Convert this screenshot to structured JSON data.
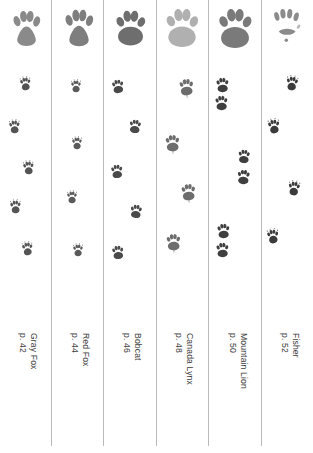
{
  "page": {
    "background_color": "#ffffff",
    "divider_color": "#b9b9b9",
    "text_color": "#3d3d3d",
    "columns_count": 6
  },
  "columns": [
    {
      "id": "gray-fox",
      "species": "Gray Fox",
      "page_ref": "p. 42",
      "x": 0,
      "width": 51,
      "hero_track": {
        "x": 10,
        "y": 8,
        "w": 33,
        "h": 42,
        "tone": "#8a8a8a",
        "style": "canine",
        "blur": 0.55
      },
      "trail": [
        {
          "x": 19,
          "y": 76,
          "size": 13,
          "rot": -6,
          "tone": "#545454"
        },
        {
          "x": 8,
          "y": 119,
          "size": 13,
          "rot": -4,
          "tone": "#545454"
        },
        {
          "x": 22,
          "y": 160,
          "size": 13,
          "rot": -5,
          "tone": "#545454"
        },
        {
          "x": 9,
          "y": 199,
          "size": 13,
          "rot": -3,
          "tone": "#545454"
        },
        {
          "x": 21,
          "y": 241,
          "size": 13,
          "rot": -6,
          "tone": "#545454"
        }
      ],
      "gait": "zigzag-single"
    },
    {
      "id": "red-fox",
      "species": "Red Fox",
      "page_ref": "p. 44",
      "x": 52,
      "width": 51,
      "hero_track": {
        "x": 10,
        "y": 6,
        "w": 34,
        "h": 45,
        "tone": "#7e7e7e",
        "style": "canine-furry",
        "blur": 0.7
      },
      "trail": [
        {
          "x": 18,
          "y": 79,
          "size": 12,
          "rot": -2,
          "tone": "#5a5a5a"
        },
        {
          "x": 19,
          "y": 136,
          "size": 12,
          "rot": -2,
          "tone": "#5a5a5a"
        },
        {
          "x": 14,
          "y": 190,
          "size": 12,
          "rot": -2,
          "tone": "#5a5a5a"
        },
        {
          "x": 20,
          "y": 243,
          "size": 12,
          "rot": -2,
          "tone": "#5a5a5a"
        }
      ],
      "gait": "direct-register-line"
    },
    {
      "id": "bobcat",
      "species": "Bobcat",
      "page_ref": "p. 46",
      "x": 104,
      "width": 51,
      "hero_track": {
        "x": 9,
        "y": 7,
        "w": 35,
        "h": 42,
        "tone": "#6e6e6e",
        "style": "feline",
        "blur": 0.35
      },
      "trail": [
        {
          "x": 7,
          "y": 78,
          "size": 14,
          "rot": -8,
          "tone": "#4a4a4a"
        },
        {
          "x": 24,
          "y": 118,
          "size": 14,
          "rot": 6,
          "tone": "#4a4a4a"
        },
        {
          "x": 6,
          "y": 163,
          "size": 14,
          "rot": -6,
          "tone": "#4a4a4a"
        },
        {
          "x": 25,
          "y": 203,
          "size": 14,
          "rot": 5,
          "tone": "#4a4a4a"
        },
        {
          "x": 7,
          "y": 244,
          "size": 14,
          "rot": -7,
          "tone": "#4a4a4a"
        }
      ],
      "gait": "zigzag-single"
    },
    {
      "id": "canada-lynx",
      "species": "Canada Lynx",
      "page_ref": "p. 48",
      "x": 156,
      "width": 51,
      "hero_track": {
        "x": 7,
        "y": 5,
        "w": 38,
        "h": 46,
        "tone": "#b0b0b0",
        "style": "feline-furry",
        "blur": 1.6
      },
      "trail": [
        {
          "x": 22,
          "y": 77,
          "size": 17,
          "rot": -4,
          "tone": "#6d6d6d",
          "drag": true
        },
        {
          "x": 8,
          "y": 133,
          "size": 17,
          "rot": -3,
          "tone": "#6d6d6d",
          "drag": true
        },
        {
          "x": 24,
          "y": 182,
          "size": 17,
          "rot": -4,
          "tone": "#6d6d6d",
          "drag": true
        },
        {
          "x": 9,
          "y": 232,
          "size": 17,
          "rot": -3,
          "tone": "#6d6d6d",
          "drag": true
        }
      ],
      "gait": "snowshoe-drag"
    },
    {
      "id": "mountain-lion",
      "species": "Mountain Lion",
      "page_ref": "p. 50",
      "x": 208,
      "width": 53,
      "hero_track": {
        "x": 8,
        "y": 5,
        "w": 38,
        "h": 47,
        "tone": "#7a7a7a",
        "style": "feline-large",
        "blur": 0.4
      },
      "trail": [
        {
          "x": 7,
          "y": 76,
          "size": 15,
          "rot": -3,
          "tone": "#3f3f3f"
        },
        {
          "x": 6,
          "y": 94,
          "size": 15,
          "rot": -3,
          "tone": "#3f3f3f"
        },
        {
          "x": 29,
          "y": 148,
          "size": 14,
          "rot": 3,
          "tone": "#3f3f3f"
        },
        {
          "x": 28,
          "y": 168,
          "size": 15,
          "rot": 3,
          "tone": "#3f3f3f"
        },
        {
          "x": 8,
          "y": 222,
          "size": 15,
          "rot": -3,
          "tone": "#3f3f3f"
        },
        {
          "x": 7,
          "y": 241,
          "size": 15,
          "rot": -3,
          "tone": "#3f3f3f"
        }
      ],
      "gait": "paired-bound"
    },
    {
      "id": "fisher",
      "species": "Fisher",
      "page_ref": "p. 52",
      "x": 261,
      "width": 52,
      "hero_track": {
        "x": 9,
        "y": 6,
        "w": 34,
        "h": 44,
        "tone": "#8b8b8b",
        "style": "mustelid",
        "blur": 0.5
      },
      "trail": [
        {
          "x": 24,
          "y": 75,
          "size": 14,
          "rot": 6,
          "tone": "#3b3b3b"
        },
        {
          "x": 6,
          "y": 118,
          "size": 14,
          "rot": -8,
          "tone": "#3b3b3b"
        },
        {
          "x": 26,
          "y": 180,
          "size": 14,
          "rot": 5,
          "tone": "#3b3b3b"
        },
        {
          "x": 5,
          "y": 228,
          "size": 14,
          "rot": -7,
          "tone": "#3b3b3b"
        }
      ],
      "gait": "zigzag-single"
    }
  ],
  "dividers": [
    {
      "x": 51
    },
    {
      "x": 103
    },
    {
      "x": 156
    },
    {
      "x": 208
    },
    {
      "x": 261
    }
  ]
}
